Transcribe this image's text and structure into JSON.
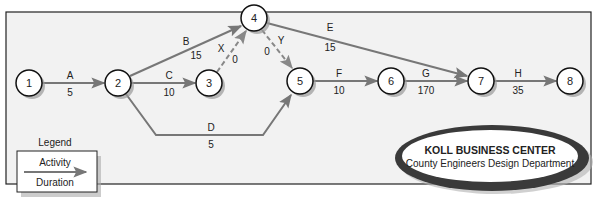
{
  "diagram": {
    "type": "activity-on-arrow network",
    "colors": {
      "frame_fill": "#f2f2f2",
      "frame_stroke": "#222222",
      "node_fill": "#ffffff",
      "node_stroke": "#111111",
      "node_shadow": "#9a9a9a",
      "arrow": "#777777",
      "dummy_arrow": "#888888",
      "ellipse_ring": "#3a3a3a"
    },
    "nodes": [
      {
        "id": "1",
        "label": "1",
        "x": 29,
        "y": 83
      },
      {
        "id": "2",
        "label": "2",
        "x": 118,
        "y": 83
      },
      {
        "id": "3",
        "label": "3",
        "x": 209,
        "y": 83
      },
      {
        "id": "4",
        "label": "4",
        "x": 254,
        "y": 18
      },
      {
        "id": "5",
        "label": "5",
        "x": 300,
        "y": 81
      },
      {
        "id": "6",
        "label": "6",
        "x": 391,
        "y": 81
      },
      {
        "id": "7",
        "label": "7",
        "x": 481,
        "y": 81
      },
      {
        "id": "8",
        "label": "8",
        "x": 570,
        "y": 81
      }
    ],
    "activities": [
      {
        "name": "A",
        "duration": "5",
        "from": "1",
        "to": "2",
        "dummy": false
      },
      {
        "name": "B",
        "duration": "15",
        "from": "2",
        "to": "4",
        "dummy": false
      },
      {
        "name": "C",
        "duration": "10",
        "from": "2",
        "to": "3",
        "dummy": false
      },
      {
        "name": "D",
        "duration": "5",
        "from": "2",
        "to": "5",
        "dummy": false
      },
      {
        "name": "E",
        "duration": "15",
        "from": "4",
        "to": "7",
        "dummy": false
      },
      {
        "name": "F",
        "duration": "10",
        "from": "5",
        "to": "6",
        "dummy": false
      },
      {
        "name": "G",
        "duration": "170",
        "from": "6",
        "to": "7",
        "dummy": false
      },
      {
        "name": "H",
        "duration": "35",
        "from": "7",
        "to": "8",
        "dummy": false
      },
      {
        "name": "X",
        "duration": "0",
        "from": "3",
        "to": "4",
        "dummy": true
      },
      {
        "name": "Y",
        "duration": "0",
        "from": "4",
        "to": "5",
        "dummy": true
      }
    ],
    "legend": {
      "title": "Legend",
      "top_label": "Activity",
      "bottom_label": "Duration"
    },
    "title_badge": {
      "line1": "KOLL BUSINESS CENTER",
      "line2": "County Engineers Design Department"
    }
  }
}
